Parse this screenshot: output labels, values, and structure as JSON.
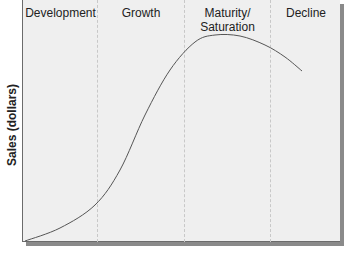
{
  "chart_data": {
    "type": "line",
    "title": "",
    "xlabel": "",
    "ylabel": "Sales (dollars)",
    "stages": [
      "Development",
      "Growth",
      "Maturity/\nSaturation",
      "Decline"
    ],
    "stage_boundaries_px": [
      97,
      184,
      270
    ],
    "series": [
      {
        "name": "Product life cycle sales",
        "points_px": [
          [
            25,
            241
          ],
          [
            60,
            228
          ],
          [
            95,
            205
          ],
          [
            120,
            170
          ],
          [
            145,
            115
          ],
          [
            170,
            70
          ],
          [
            195,
            42
          ],
          [
            215,
            35
          ],
          [
            240,
            36
          ],
          [
            265,
            45
          ],
          [
            285,
            57
          ],
          [
            302,
            71
          ]
        ]
      }
    ],
    "grid": false,
    "legend": "none",
    "axis_ticks": "none"
  },
  "labels": {
    "ylabel": "Sales (dollars)",
    "stage1": "Development",
    "stage2": "Growth",
    "stage3_line1": "Maturity/",
    "stage3_line2": "Saturation",
    "stage4": "Decline"
  }
}
